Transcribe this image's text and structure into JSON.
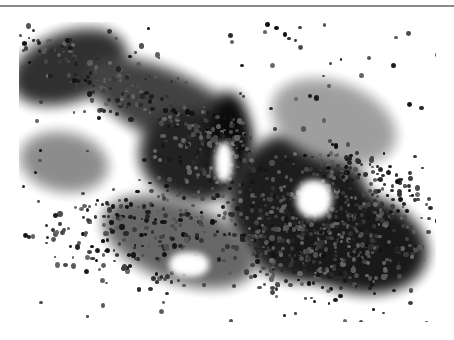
{
  "figure": {
    "caption_cutoff": "",
    "image_alt": "Cytology micrograph showing dense clusters of small round cells",
    "background": "#ffffff",
    "photo_background": "#f3f3f3",
    "rule_color": "#8a8a8a"
  },
  "masses": [
    {
      "x": -10,
      "y": 10,
      "w": 120,
      "h": 70,
      "c": "#3a3a3a",
      "r": -20
    },
    {
      "x": 60,
      "y": 50,
      "w": 180,
      "h": 70,
      "c": "#4a4a4a",
      "r": 25
    },
    {
      "x": 120,
      "y": 90,
      "w": 110,
      "h": 90,
      "c": "#2e2e2e",
      "r": 10
    },
    {
      "x": 190,
      "y": 70,
      "w": 40,
      "h": 80,
      "c": "#1a1a1a",
      "r": 0
    },
    {
      "x": 210,
      "y": 110,
      "w": 140,
      "h": 150,
      "c": "#2a2a2a",
      "r": -15
    },
    {
      "x": 260,
      "y": 170,
      "w": 150,
      "h": 100,
      "c": "#262626",
      "r": 15
    },
    {
      "x": 80,
      "y": 180,
      "w": 160,
      "h": 80,
      "c": "#6a6a6a",
      "r": 20
    },
    {
      "x": 0,
      "y": 110,
      "w": 90,
      "h": 60,
      "c": "#8a8a8a",
      "r": 10
    },
    {
      "x": 250,
      "y": 60,
      "w": 130,
      "h": 80,
      "c": "#9a9a9a",
      "r": 20
    }
  ],
  "holes": [
    {
      "x": 277,
      "y": 158,
      "w": 36,
      "h": 38
    },
    {
      "x": 196,
      "y": 120,
      "w": 18,
      "h": 40
    },
    {
      "x": 150,
      "y": 230,
      "w": 40,
      "h": 25
    }
  ],
  "cell_seed": 20240521,
  "cell_count": 1400
}
